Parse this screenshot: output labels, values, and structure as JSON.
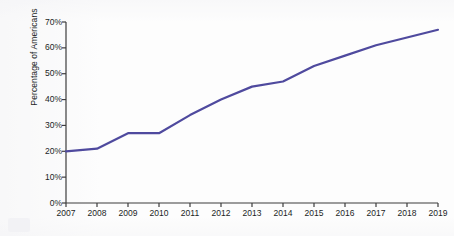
{
  "chart_data": {
    "type": "line",
    "title": "",
    "xlabel": "",
    "ylabel": "Percentage of Americans",
    "x": [
      2007,
      2008,
      2009,
      2010,
      2011,
      2012,
      2013,
      2014,
      2015,
      2016,
      2017,
      2018,
      2019
    ],
    "categories": [
      "2007",
      "2008",
      "2009",
      "2010",
      "2011",
      "2012",
      "2013",
      "2014",
      "2015",
      "2016",
      "2017",
      "2018",
      "2019"
    ],
    "values": [
      20,
      21,
      27,
      27,
      34,
      40,
      45,
      47,
      53,
      57,
      61,
      64,
      67
    ],
    "series": [
      {
        "name": "Percentage of Americans",
        "color": "#4f4a9e",
        "values": [
          20,
          21,
          27,
          27,
          34,
          40,
          45,
          47,
          53,
          57,
          61,
          64,
          67
        ]
      }
    ],
    "ylim": [
      0,
      70
    ],
    "xlim": [
      2007,
      2019
    ],
    "ytick_labels": [
      "0%",
      "10%",
      "20%",
      "30%",
      "40%",
      "50%",
      "60%",
      "70%"
    ],
    "ytick_values": [
      0,
      10,
      20,
      30,
      40,
      50,
      60,
      70
    ],
    "xtick_labels": [
      "2007",
      "2008",
      "2009",
      "2010",
      "2011",
      "2012",
      "2013",
      "2014",
      "2015",
      "2016",
      "2017",
      "2018",
      "2019"
    ],
    "grid": false,
    "legend": false,
    "legend_position": "none",
    "line_color": "#4f4a9e",
    "axis_color": "#3d3d3d",
    "background_color": "#fdfdfd",
    "annotations": []
  }
}
